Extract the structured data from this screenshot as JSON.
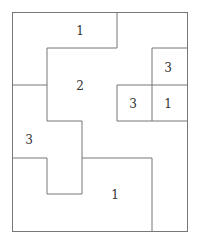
{
  "puzzle": {
    "type": "region-number-grid",
    "cols": 5,
    "rows": 6,
    "clues": [
      {
        "label": "1",
        "x": 72,
        "y": 30
      },
      {
        "label": "2",
        "x": 72,
        "y": 85
      },
      {
        "label": "3",
        "x": 160,
        "y": 67
      },
      {
        "label": "3",
        "x": 125,
        "y": 103
      },
      {
        "label": "1",
        "x": 160,
        "y": 103
      },
      {
        "label": "3",
        "x": 20,
        "y": 139
      },
      {
        "label": "1",
        "x": 107,
        "y": 194
      }
    ]
  }
}
